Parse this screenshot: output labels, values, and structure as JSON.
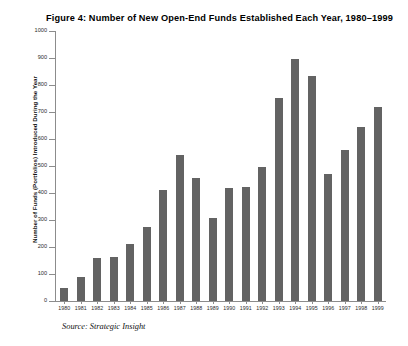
{
  "figure": {
    "title": "Figure 4: Number of New Open-End Funds Established Each Year, 1980–1999",
    "source_note": "Source: Strategic Insight"
  },
  "chart_data": {
    "type": "bar",
    "title": "Figure 4: Number of New Open-End Funds Established Each Year, 1980–1999",
    "xlabel": "",
    "ylabel": "Number of Funds (Portfolios) Introduced During the Year",
    "categories": [
      "1980",
      "1981",
      "1982",
      "1983",
      "1984",
      "1985",
      "1986",
      "1987",
      "1988",
      "1989",
      "1990",
      "1991",
      "1992",
      "1993",
      "1994",
      "1995",
      "1996",
      "1997",
      "1998",
      "1999"
    ],
    "values": [
      50,
      88,
      160,
      163,
      212,
      275,
      413,
      540,
      455,
      308,
      418,
      422,
      497,
      752,
      895,
      835,
      472,
      558,
      645,
      718
    ],
    "ylim": [
      0,
      1000
    ],
    "yticks": [
      0,
      100,
      200,
      300,
      400,
      500,
      600,
      700,
      800,
      900,
      1000
    ],
    "ytick_labels": [
      "0",
      "100",
      "200",
      "300",
      "400",
      "500",
      "600",
      "700",
      "800",
      "900",
      "1000"
    ],
    "grid": false,
    "legend": null,
    "bar_color": "#636363",
    "axis_color": "#8c8c8c"
  }
}
